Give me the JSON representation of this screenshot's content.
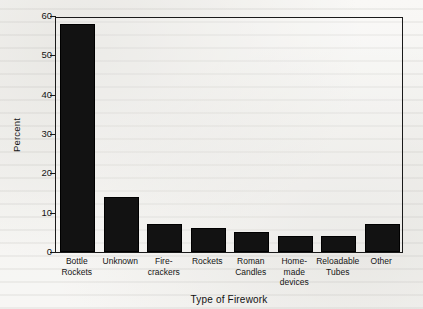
{
  "document": {
    "background_color": "#f3f2ef",
    "ink_color": "#121212"
  },
  "chart_data": {
    "type": "bar",
    "title": "",
    "subtitle": "",
    "xlabel": "Type of Firework",
    "ylabel": "Percent",
    "categories": [
      "Bottle\nRockets",
      "Unknown",
      "Fire-\ncrackers",
      "Rockets",
      "Roman\nCandles",
      "Home-\nmade\ndevices",
      "Reloadable\nTubes",
      "Other"
    ],
    "values": [
      58,
      14,
      7,
      6,
      5,
      4,
      4,
      7
    ],
    "ylim": [
      0,
      60
    ],
    "yticks": [
      0,
      10,
      20,
      30,
      40,
      50,
      60
    ],
    "ytick_labels": [
      "0",
      "10",
      "20",
      "30",
      "40",
      "50",
      "60"
    ],
    "grid": false,
    "legend": "none",
    "bar_color": "#121212",
    "axis_color": "#1a1a1a",
    "frame": "box"
  }
}
